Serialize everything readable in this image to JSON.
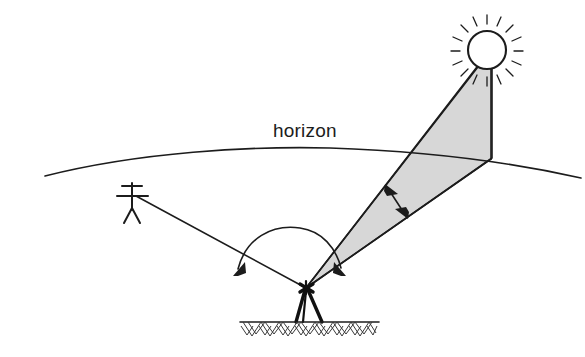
{
  "diagram": {
    "title": "horizon",
    "canvas": {
      "width": 585,
      "height": 357,
      "background": "#ffffff"
    },
    "labels": {
      "horizon": "horizon"
    },
    "colors": {
      "ink": "#1c1c1c",
      "shade_fill": "#d7d7d7",
      "ground_hatch": "#3a3a3a",
      "background": "#ffffff"
    },
    "elements": [
      {
        "name": "horizon-curve",
        "type": "curve",
        "description": "shallow arc representing the horizon"
      },
      {
        "name": "sun",
        "type": "circle",
        "description": "sun disc with radiating rays",
        "center_x": 487,
        "center_y": 50,
        "radius": 19,
        "ray_count": 16
      },
      {
        "name": "sun-shade-wedge",
        "type": "polygon",
        "description": "shaded triangle from observer to sun and down to horizon"
      },
      {
        "name": "vertical-drop-line",
        "type": "line",
        "description": "vertical line from sun down to horizon"
      },
      {
        "name": "observer-tripod",
        "type": "instrument",
        "description": "theodolite on tripod standing on hatched ground"
      },
      {
        "name": "reference-person",
        "type": "stick-figure",
        "description": "distant person used as reference target"
      },
      {
        "name": "sight-line-to-person",
        "type": "line",
        "description": "line of sight from instrument to person"
      },
      {
        "name": "sight-line-to-sun",
        "type": "line",
        "description": "line of sight from instrument to sun"
      },
      {
        "name": "horizontal-angle-arc",
        "type": "arc",
        "description": "double headed arc measuring the horizontal angle between the two sight lines"
      },
      {
        "name": "vertical-angle-arrow",
        "type": "double-arrow",
        "description": "double headed arrow across the shaded wedge"
      },
      {
        "name": "ground-line",
        "type": "line",
        "description": "ground surface line with chevron hatching below"
      }
    ]
  }
}
